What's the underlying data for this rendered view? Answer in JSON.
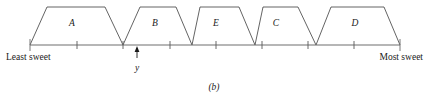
{
  "figure": {
    "caption": "(b)",
    "axis": {
      "left_label": "Least sweet",
      "right_label": "Most sweet",
      "x_start": 30,
      "x_end": 400,
      "y": 45,
      "end_tick_half_height": 6,
      "tick_half_height": 4,
      "interior_ticks": [
        77,
        123,
        170,
        216,
        262,
        308,
        354
      ],
      "end_caps": [
        30,
        400
      ]
    },
    "pointer": {
      "label": "y",
      "x": 137,
      "tip_y": 45,
      "tail_y": 58,
      "label_y": 71
    },
    "sets": [
      {
        "name": "A",
        "label_x": 72,
        "label_y": 26,
        "base_left": 30,
        "top_left": 47,
        "top_right": 105,
        "base_right": 123,
        "top_y": 7,
        "base_y": 45
      },
      {
        "name": "B",
        "label_x": 155,
        "label_y": 26,
        "base_left": 123,
        "top_left": 140,
        "top_right": 176,
        "base_right": 192,
        "top_y": 7,
        "base_y": 45
      },
      {
        "name": "E",
        "label_x": 216,
        "label_y": 26,
        "base_left": 192,
        "top_left": 200,
        "top_right": 239,
        "base_right": 255,
        "top_y": 7,
        "base_y": 45
      },
      {
        "name": "C",
        "label_x": 276,
        "label_y": 26,
        "base_left": 255,
        "top_left": 263,
        "top_right": 298,
        "base_right": 316,
        "top_y": 7,
        "base_y": 45
      },
      {
        "name": "D",
        "label_x": 355,
        "label_y": 26,
        "base_left": 316,
        "top_left": 331,
        "top_right": 384,
        "base_right": 400,
        "top_y": 7,
        "base_y": 45
      }
    ],
    "labels": {
      "left_label_x": 6,
      "left_label_y": 60,
      "right_label_x": 423,
      "right_label_y": 60,
      "caption_x": 214,
      "caption_y": 90
    },
    "colors": {
      "outline": "#3c3c3c",
      "axis": "#6e6e6e",
      "text": "#1a1a1a",
      "background": "#ffffff"
    }
  },
  "chart_data": {
    "type": "line",
    "title": "",
    "subtitle": "(b)",
    "xlabel": "",
    "ylabel": "",
    "xlim": [
      30,
      400
    ],
    "ylim": [
      0,
      1
    ],
    "grid": false,
    "legend": "none",
    "annotations": [
      {
        "text": "Least sweet",
        "x": 30,
        "position": "below-axis-left"
      },
      {
        "text": "Most sweet",
        "x": 400,
        "position": "below-axis-right"
      },
      {
        "text": "y",
        "x": 137,
        "position": "arrow-below-axis"
      }
    ],
    "series": [
      {
        "name": "A",
        "x": [
          30,
          47,
          105,
          123
        ],
        "values": [
          0,
          1,
          1,
          0
        ]
      },
      {
        "name": "B",
        "x": [
          123,
          140,
          176,
          192
        ],
        "values": [
          0,
          1,
          1,
          0
        ]
      },
      {
        "name": "E",
        "x": [
          192,
          200,
          239,
          255
        ],
        "values": [
          0,
          1,
          1,
          0
        ]
      },
      {
        "name": "C",
        "x": [
          255,
          263,
          298,
          316
        ],
        "values": [
          0,
          1,
          1,
          0
        ]
      },
      {
        "name": "D",
        "x": [
          316,
          331,
          384,
          400
        ],
        "values": [
          0,
          1,
          1,
          0
        ]
      }
    ]
  }
}
